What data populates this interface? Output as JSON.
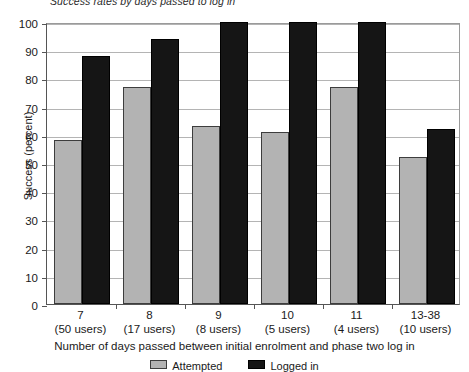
{
  "chart_data": {
    "type": "bar",
    "title": "Success rates by days passed to log in",
    "xlabel": "Number of days passed between initial enrolment and phase two log in",
    "ylabel": "Success (percent)",
    "ylim": [
      0,
      100
    ],
    "ytick_step": 10,
    "yticks": [
      "100",
      "90",
      "80",
      "70",
      "60",
      "50",
      "40",
      "30",
      "20",
      "10",
      "0"
    ],
    "grid": true,
    "legend_position": "bottom",
    "categories": [
      "7",
      "8",
      "9",
      "10",
      "11",
      "13-38"
    ],
    "category_sublabels": [
      "(50 users)",
      "(17 users)",
      "(8 users)",
      "(5 users)",
      "(4 users)",
      "(10 users)"
    ],
    "series": [
      {
        "name": "Attempted",
        "color": "#b3b3b3",
        "values": [
          58,
          77,
          63,
          61,
          77,
          52
        ]
      },
      {
        "name": "Logged in",
        "color": "#151515",
        "values": [
          88,
          94,
          100,
          100,
          100,
          62
        ]
      }
    ]
  },
  "legend": {
    "items": [
      {
        "label": "Attempted",
        "color": "#b3b3b3"
      },
      {
        "label": "Logged in",
        "color": "#151515"
      }
    ]
  }
}
